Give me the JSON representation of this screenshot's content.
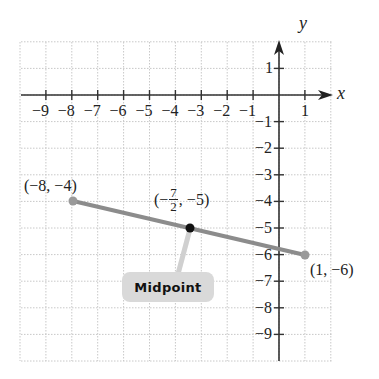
{
  "chart_data": {
    "type": "scatter",
    "title": "",
    "xlabel": "x",
    "ylabel": "y",
    "xlim": [
      -10,
      2
    ],
    "ylim": [
      -10,
      2
    ],
    "grid": true,
    "x_ticks": [
      "-9",
      "-8",
      "-7",
      "-6",
      "-5",
      "-4",
      "-3",
      "-2",
      "-1",
      "1"
    ],
    "y_ticks": [
      "1",
      "-1",
      "-2",
      "-3",
      "-4",
      "-5",
      "-6",
      "-7",
      "-8",
      "-9"
    ],
    "segment": {
      "from": [
        -8,
        -4
      ],
      "to": [
        1,
        -6
      ],
      "color": "#8c8c8c"
    },
    "points": [
      {
        "x": -8,
        "y": -4,
        "label": "(−8, −4)",
        "color": "#8c8c8c"
      },
      {
        "x": -3.5,
        "y": -5,
        "label": "(−7/2, −5)",
        "color": "#111111"
      },
      {
        "x": 1,
        "y": -6,
        "label": "(1, −6)",
        "color": "#8c8c8c"
      }
    ],
    "annotations": [
      {
        "text": "Midpoint",
        "points_to": [
          -3.5,
          -5
        ]
      }
    ]
  },
  "labels": {
    "x_axis": "x",
    "y_axis": "y",
    "x_ticks": [
      "−9",
      "−8",
      "−7",
      "−6",
      "−5",
      "−4",
      "−3",
      "−2",
      "−1",
      "1"
    ],
    "y_ticks": [
      "1",
      "−1",
      "−2",
      "−3",
      "−4",
      "−5",
      "−6",
      "−7",
      "−8",
      "−9"
    ],
    "p1": "(−8, −4)",
    "p3": "(1, −6)",
    "mid_open": "(−",
    "mid_num": "7",
    "mid_den": "2",
    "mid_close": ", −5)",
    "callout": "Midpoint"
  }
}
